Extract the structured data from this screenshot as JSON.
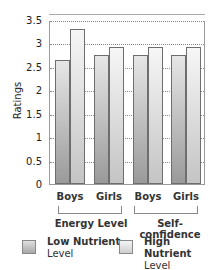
{
  "chart_data": {
    "type": "bar",
    "title": "",
    "xlabel": "",
    "ylabel": "Ratings",
    "ylim": [
      0,
      3.5
    ],
    "yticks": [
      "0",
      "0.5",
      "1",
      "1.5",
      "2",
      "2.5",
      "3",
      "3.5"
    ],
    "grid": "horizontal dotted",
    "groups": [
      {
        "label": "Energy Level",
        "categories": [
          "Boys",
          "Girls"
        ]
      },
      {
        "label": "Self-confidence",
        "categories": [
          "Boys",
          "Girls"
        ]
      }
    ],
    "categories": [
      "Boys",
      "Girls",
      "Boys",
      "Girls"
    ],
    "series": [
      {
        "name": "Low Nutrient Level",
        "values": [
          2.65,
          2.75,
          2.75,
          2.75
        ]
      },
      {
        "name": "High Nutrient Level",
        "values": [
          3.3,
          2.92,
          2.92,
          2.92
        ]
      }
    ],
    "legend_position": "bottom"
  },
  "legend": {
    "low": "Low Nutrient Level",
    "low_line1": "Low Nutrient",
    "low_line2": "Level",
    "high_line1": "High Nutrient",
    "high_line2": "Level"
  }
}
